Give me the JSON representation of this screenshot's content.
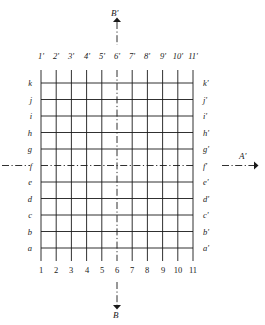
{
  "figure": {
    "type": "orthographic-grid-with-section-lines",
    "background_color": "#ffffff",
    "line_color": "#1a1a1a",
    "grid": {
      "columns": 11,
      "rows": 11,
      "left_px": 41,
      "right_px": 193,
      "top_px": 83,
      "bottom_px": 248,
      "column_spacing_px": 15.2,
      "row_spacing_px": 16.5,
      "centerline_column_index": 6,
      "centerline_row_label": "f"
    },
    "column_labels_top": [
      "1'",
      "2'",
      "3'",
      "4'",
      "5'",
      "6'",
      "7'",
      "8'",
      "9'",
      "10'",
      "11'"
    ],
    "column_labels_bottom": [
      "1",
      "2",
      "3",
      "4",
      "5",
      "6",
      "7",
      "8",
      "9",
      "10",
      "11"
    ],
    "row_labels_left": [
      "k",
      "j",
      "i",
      "h",
      "g",
      "f",
      "e",
      "d",
      "c",
      "b",
      "a"
    ],
    "row_labels_right": [
      "k'",
      "j'",
      "i'",
      "h'",
      "g'",
      "f'",
      "e'",
      "d'",
      "c'",
      "b'",
      "a'"
    ],
    "section_lines": {
      "horizontal": {
        "name": "A-A'",
        "row": "f",
        "end_label_right": "A'",
        "style": "dash-dot",
        "arrow_direction": "right"
      },
      "vertical": {
        "name": "B-B'",
        "column": "6",
        "end_label_top": "B'",
        "end_label_bottom": "B",
        "style": "dash-dot",
        "arrow_direction_top": "up",
        "arrow_direction_bottom": "down"
      }
    }
  }
}
